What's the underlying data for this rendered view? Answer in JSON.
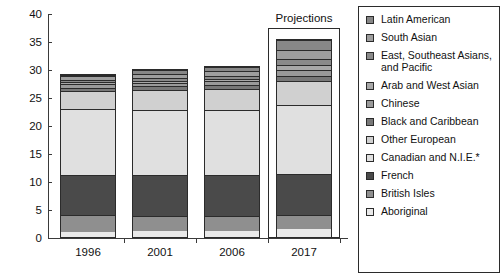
{
  "chart_data": {
    "type": "bar",
    "subtype": "stacked-bar",
    "title": "",
    "xlabel": "",
    "ylabel": "",
    "categories": [
      "1996",
      "2001",
      "2006",
      "2017"
    ],
    "ylim": [
      0,
      40
    ],
    "yticks": [
      0,
      5,
      10,
      15,
      20,
      25,
      30,
      35,
      40
    ],
    "ytick_labels": [
      "0",
      "5",
      "10",
      "15",
      "20",
      "25",
      "30",
      "35",
      "40"
    ],
    "grid": false,
    "legend_position": "right",
    "annotations": [
      {
        "text": "Projections",
        "applies_to": "2017"
      }
    ],
    "totals": [
      29.0,
      29.9,
      30.3,
      35.2
    ],
    "series_order_bottom_to_top": [
      "Aboriginal",
      "British Isles",
      "French",
      "Canadian and N.I.E.*",
      "Other European",
      "Black and Caribbean",
      "Chinese",
      "Arab and West Asian",
      "East, Southeast Asians, and Pacific",
      "South Asian",
      "Latin American"
    ],
    "series": [
      {
        "name": "Aboriginal",
        "color": "#e9e9e9",
        "values": [
          0.9,
          1.0,
          1.1,
          1.5
        ]
      },
      {
        "name": "British Isles",
        "color": "#8f8f8f",
        "values": [
          3.1,
          2.7,
          2.6,
          2.5
        ]
      },
      {
        "name": "French",
        "color": "#4a4a4a",
        "values": [
          7.1,
          7.4,
          7.4,
          7.2
        ]
      },
      {
        "name": "Canadian and N.I.E.*",
        "color": "#e0e0e0",
        "values": [
          11.8,
          11.6,
          11.6,
          12.3
        ]
      },
      {
        "name": "Other European",
        "color": "#d0d0d0",
        "values": [
          3.2,
          3.5,
          3.7,
          4.3
        ]
      },
      {
        "name": "Black and Caribbean",
        "color": "#787878",
        "values": [
          0.6,
          0.7,
          0.75,
          1.0
        ]
      },
      {
        "name": "Chinese",
        "color": "#9a9a9a",
        "values": [
          0.55,
          0.6,
          0.65,
          1.1
        ]
      },
      {
        "name": "Arab and West Asian",
        "color": "#a8a8a8",
        "values": [
          0.35,
          0.4,
          0.45,
          0.85
        ]
      },
      {
        "name": "East, Southeast Asians, and Pacific",
        "color": "#8a8a8a",
        "values": [
          0.5,
          0.55,
          0.6,
          1.05
        ]
      },
      {
        "name": "South Asian",
        "color": "#9e9e9e",
        "values": [
          0.6,
          0.7,
          0.8,
          1.6
        ]
      },
      {
        "name": "Latin American",
        "color": "#878787",
        "values": [
          0.3,
          0.75,
          0.65,
          1.8
        ]
      }
    ]
  },
  "legend": {
    "items": [
      {
        "label": "Latin American",
        "color": "#878787"
      },
      {
        "label": "South Asian",
        "color": "#9e9e9e"
      },
      {
        "label": "East, Southeast Asians, and Pacific",
        "color": "#8a8a8a"
      },
      {
        "label": "Arab and West Asian",
        "color": "#a8a8a8"
      },
      {
        "label": "Chinese",
        "color": "#9a9a9a"
      },
      {
        "label": "Black and Caribbean",
        "color": "#787878"
      },
      {
        "label": "Other European",
        "color": "#d0d0d0"
      },
      {
        "label": "Canadian and N.I.E.*",
        "color": "#e0e0e0"
      },
      {
        "label": "French",
        "color": "#4a4a4a"
      },
      {
        "label": "British Isles",
        "color": "#8f8f8f"
      },
      {
        "label": "Aboriginal",
        "color": "#e9e9e9"
      }
    ]
  },
  "projections": {
    "label": "Projections"
  }
}
